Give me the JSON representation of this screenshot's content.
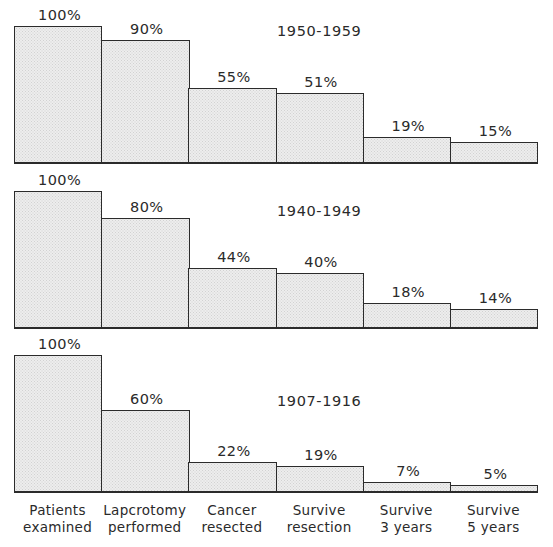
{
  "chart_data": {
    "type": "bar",
    "title": "",
    "subtitle": "",
    "xlabel": "",
    "ylabel": "",
    "ylim": [
      0,
      100
    ],
    "grid": false,
    "legend_position": "none",
    "value_suffix": "%",
    "categories": [
      "Patients examined",
      "Lapcrotomy performed",
      "Cancer resected",
      "Survive resection",
      "Survive 3 years",
      "Survive 5 years"
    ],
    "category_lines": [
      [
        "Patients",
        "examined"
      ],
      [
        "Lapcrotomy",
        "performed"
      ],
      [
        "Cancer",
        "resected"
      ],
      [
        "Survive",
        "resection"
      ],
      [
        "Survive",
        "3 years"
      ],
      [
        "Survive",
        "5 years"
      ]
    ],
    "panels": [
      {
        "title": "1950-1959",
        "values": [
          100,
          90,
          55,
          51,
          19,
          15
        ],
        "labels": [
          "100%",
          "90%",
          "55%",
          "51%",
          "19%",
          "15%"
        ]
      },
      {
        "title": "1940-1949",
        "values": [
          100,
          80,
          44,
          40,
          18,
          14
        ],
        "labels": [
          "100%",
          "80%",
          "44%",
          "40%",
          "18%",
          "14%"
        ]
      },
      {
        "title": "1907-1916",
        "values": [
          100,
          60,
          22,
          19,
          7,
          5
        ],
        "labels": [
          "100%",
          "60%",
          "22%",
          "19%",
          "7%",
          "5%"
        ]
      }
    ],
    "series": [
      {
        "name": "1950-1959",
        "values": [
          100,
          90,
          55,
          51,
          19,
          15
        ]
      },
      {
        "name": "1940-1949",
        "values": [
          100,
          80,
          44,
          40,
          18,
          14
        ]
      },
      {
        "name": "1907-1916",
        "values": [
          100,
          60,
          22,
          19,
          7,
          5
        ]
      }
    ]
  },
  "style": {
    "bar_fill": "#ededed",
    "bar_stroke": "#2b2b2b",
    "text_color": "#2a2a2a",
    "background": "#ffffff"
  }
}
